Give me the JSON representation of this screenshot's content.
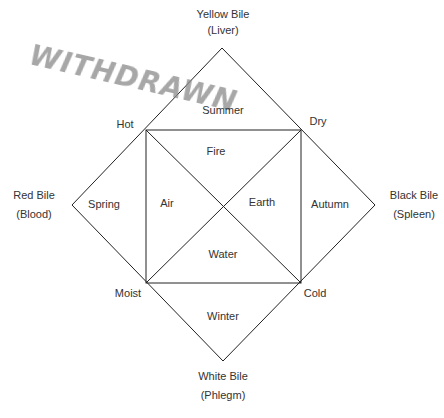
{
  "watermark": "WITHDRAWN",
  "humors": {
    "top": {
      "name": "Yellow Bile",
      "organ": "(Liver)"
    },
    "left": {
      "name": "Red Bile",
      "organ": "(Blood)"
    },
    "right": {
      "name": "Black Bile",
      "organ": "(Spleen)"
    },
    "bottom": {
      "name": "White Bile",
      "organ": "(Phlegm)"
    }
  },
  "seasons": {
    "top": "Summer",
    "left": "Spring",
    "right": "Autumn",
    "bottom": "Winter"
  },
  "qualities": {
    "top_left": "Hot",
    "top_right": "Dry",
    "bottom_left": "Moist",
    "bottom_right": "Cold"
  },
  "elements": {
    "top": "Fire",
    "left": "Air",
    "right": "Earth",
    "bottom": "Water"
  },
  "colors": {
    "line": "#222222",
    "text": "#333333",
    "watermark": "#8a8a8a"
  }
}
